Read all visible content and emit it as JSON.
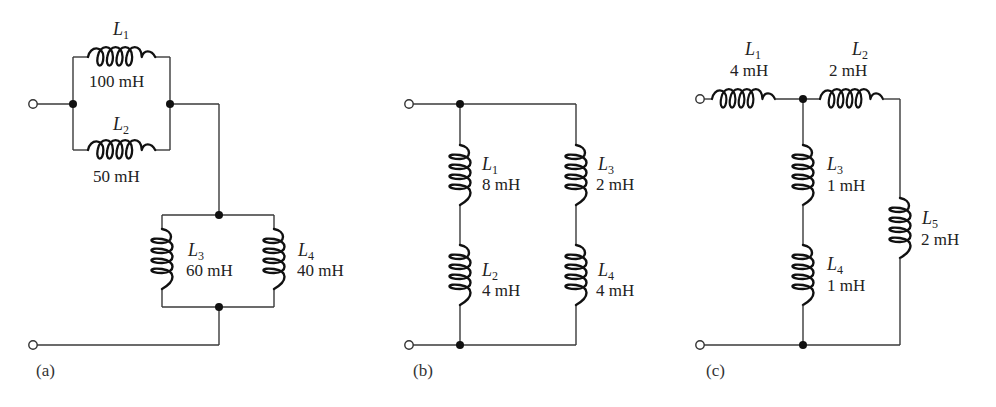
{
  "figure": {
    "panels": [
      {
        "id": "a",
        "caption": "(a)",
        "inductors": [
          {
            "name": "L",
            "sub": "1",
            "value": "100 mH"
          },
          {
            "name": "L",
            "sub": "2",
            "value": "50 mH"
          },
          {
            "name": "L",
            "sub": "3",
            "value": "60 mH"
          },
          {
            "name": "L",
            "sub": "4",
            "value": "40 mH"
          }
        ],
        "topology": "(L1 || L2) series (L3 || L4)"
      },
      {
        "id": "b",
        "caption": "(b)",
        "inductors": [
          {
            "name": "L",
            "sub": "1",
            "value": "8 mH"
          },
          {
            "name": "L",
            "sub": "2",
            "value": "4 mH"
          },
          {
            "name": "L",
            "sub": "3",
            "value": "2 mH"
          },
          {
            "name": "L",
            "sub": "4",
            "value": "4 mH"
          }
        ],
        "topology": "(L1 + L2) || (L3 + L4)"
      },
      {
        "id": "c",
        "caption": "(c)",
        "inductors": [
          {
            "name": "L",
            "sub": "1",
            "value": "4 mH"
          },
          {
            "name": "L",
            "sub": "2",
            "value": "2 mH"
          },
          {
            "name": "L",
            "sub": "3",
            "value": "1 mH"
          },
          {
            "name": "L",
            "sub": "4",
            "value": "1 mH"
          },
          {
            "name": "L",
            "sub": "5",
            "value": "2 mH"
          }
        ],
        "topology": "L1 + ((L3 + L4) || (L2 + L5))"
      }
    ],
    "colors": {
      "wire": "#3a3a3a",
      "coil": "#111111",
      "background": "#ffffff"
    }
  }
}
